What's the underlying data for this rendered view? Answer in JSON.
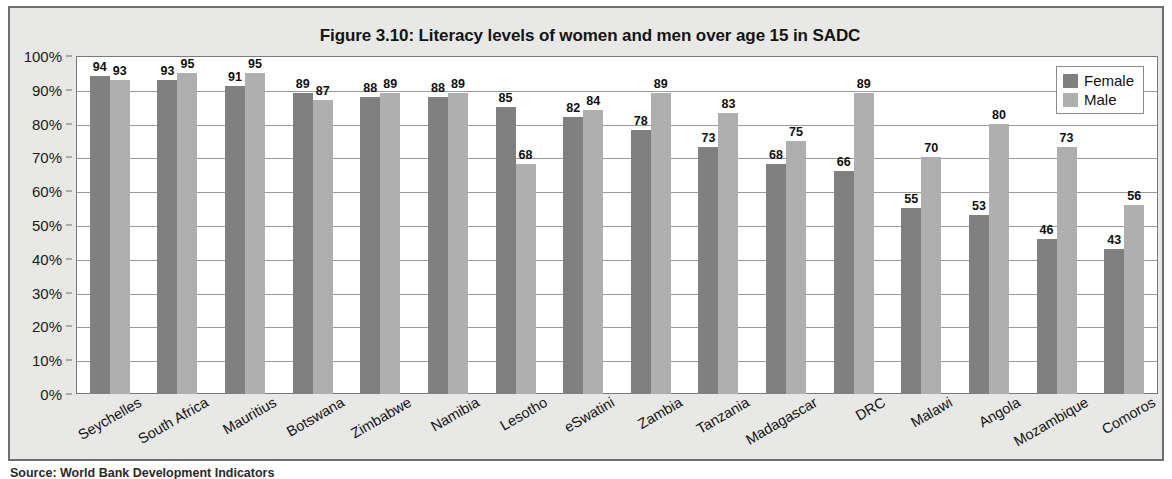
{
  "figure": {
    "title": "Figure 3.10: Literacy levels of women and men over age 15 in SADC",
    "source_caption": "Source: World Bank Development Indicators"
  },
  "legend": {
    "position": "top-right",
    "entries": [
      {
        "label": "Female",
        "color": "#808080"
      },
      {
        "label": "Male",
        "color": "#afafaf"
      }
    ]
  },
  "axes": {
    "y_ticks": [
      "0%",
      "10%",
      "20%",
      "30%",
      "40%",
      "50%",
      "60%",
      "70%",
      "80%",
      "90%",
      "100%"
    ]
  },
  "chart_data": {
    "type": "bar",
    "title": "Figure 3.10: Literacy levels of women and men over age 15 in SADC",
    "xlabel": "",
    "ylabel": "",
    "ylim": [
      0,
      100
    ],
    "ytick_format": "percent",
    "yticks": [
      0,
      10,
      20,
      30,
      40,
      50,
      60,
      70,
      80,
      90,
      100
    ],
    "grid": true,
    "legend_position": "top-right",
    "categories": [
      "Seychelles",
      "South Africa",
      "Mauritius",
      "Botswana",
      "Zimbabwe",
      "Namibia",
      "Lesotho",
      "eSwatini",
      "Zambia",
      "Tanzania",
      "Madagascar",
      "DRC",
      "Malawi",
      "Angola",
      "Mozambique",
      "Comoros"
    ],
    "series": [
      {
        "name": "Female",
        "color": "#808080",
        "values": [
          94,
          93,
          91,
          89,
          88,
          88,
          85,
          82,
          78,
          73,
          68,
          66,
          55,
          53,
          46,
          43
        ]
      },
      {
        "name": "Male",
        "color": "#afafaf",
        "values": [
          93,
          95,
          95,
          87,
          89,
          89,
          68,
          84,
          89,
          83,
          75,
          89,
          70,
          80,
          73,
          56
        ]
      }
    ]
  }
}
